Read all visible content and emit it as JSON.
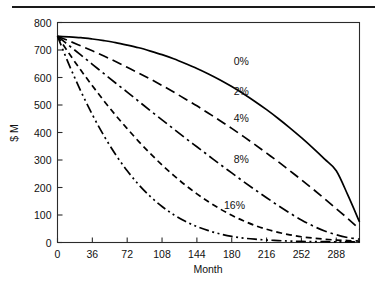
{
  "figure": {
    "top_rule": true,
    "background_color": "#ffffff",
    "line_color": "#000000"
  },
  "chart_data": {
    "type": "line",
    "title": "",
    "subtitle": "",
    "xlabel": "Month",
    "ylabel": "$ M",
    "xlim": [
      0,
      312
    ],
    "ylim": [
      0,
      800
    ],
    "xticks": [
      0,
      36,
      72,
      108,
      144,
      180,
      216,
      252,
      288
    ],
    "yticks": [
      0,
      100,
      200,
      300,
      400,
      500,
      600,
      700,
      800
    ],
    "xticklabels": [
      "0",
      "36",
      "72",
      "108",
      "144",
      "180",
      "216",
      "252",
      "288"
    ],
    "yticklabels": [
      "0",
      "100",
      "200",
      "300",
      "400",
      "500",
      "600",
      "700",
      "800"
    ],
    "grid": false,
    "legend": "inline-labels",
    "x": [
      0,
      12,
      24,
      36,
      48,
      60,
      72,
      84,
      96,
      108,
      120,
      132,
      144,
      156,
      168,
      180,
      192,
      204,
      216,
      228,
      240,
      252,
      264,
      276,
      288,
      300,
      312
    ],
    "series": [
      {
        "name": "0%",
        "label": "0%",
        "linestyle": "solid",
        "dasharray": "",
        "label_x": 182,
        "label_y": 660,
        "values": [
          750,
          748,
          745,
          740,
          734,
          727,
          718,
          708,
          696,
          683,
          668,
          651,
          633,
          613,
          591,
          567,
          541,
          513,
          483,
          451,
          417,
          381,
          343,
          303,
          261,
          172,
          75
        ]
      },
      {
        "name": "2%",
        "label": "2%",
        "linestyle": "dashed-long",
        "dasharray": "10,5",
        "label_x": 182,
        "label_y": 551,
        "values": [
          750,
          733,
          715,
          697,
          678,
          658,
          637,
          616,
          594,
          571,
          547,
          522,
          497,
          470,
          443,
          415,
          386,
          356,
          325,
          294,
          261,
          228,
          194,
          159,
          123,
          87,
          49
        ]
      },
      {
        "name": "4%",
        "label": "4%",
        "linestyle": "dash-dot",
        "dasharray": "11,4,2.5,4",
        "label_x": 182,
        "label_y": 452,
        "values": [
          750,
          716,
          682,
          648,
          614,
          580,
          547,
          513,
          479,
          446,
          413,
          380,
          348,
          316,
          284,
          253,
          222,
          192,
          163,
          134,
          107,
          82,
          60,
          42,
          28,
          18,
          12
        ]
      },
      {
        "name": "8%",
        "label": "8%",
        "linestyle": "dashed-short",
        "dasharray": "6,4",
        "label_x": 182,
        "label_y": 305,
        "values": [
          750,
          687,
          627,
          570,
          515,
          463,
          414,
          367,
          323,
          282,
          244,
          209,
          177,
          148,
          122,
          99,
          79,
          62,
          48,
          37,
          28,
          21,
          16,
          12,
          9,
          7,
          5
        ]
      },
      {
        "name": "16%",
        "label": "16%",
        "linestyle": "dash-dot-dot",
        "dasharray": "10,3.5,2,3.5,2,3.5",
        "label_x": 172,
        "label_y": 138,
        "values": [
          750,
          646,
          551,
          465,
          388,
          320,
          261,
          210,
          167,
          131,
          101,
          77,
          58,
          43,
          31,
          22,
          16,
          12,
          9,
          7,
          5,
          4,
          3,
          3,
          2,
          2,
          2
        ]
      }
    ]
  }
}
